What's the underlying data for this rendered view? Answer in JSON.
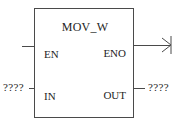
{
  "diagram": {
    "kind": "function-block-diagram",
    "block": {
      "title": "MOV_W",
      "inputs": [
        {
          "pin": "EN",
          "operand": ""
        },
        {
          "pin": "IN",
          "operand": "????"
        }
      ],
      "outputs": [
        {
          "pin": "ENO",
          "operand": ""
        },
        {
          "pin": "OUT",
          "operand": "????"
        }
      ]
    },
    "pins": {
      "en": "EN",
      "eno": "ENO",
      "in": "IN",
      "out": "OUT"
    },
    "operands": {
      "in": "????",
      "out": "????"
    },
    "icons": {
      "output_terminator": "arrow-right-terminator-icon"
    },
    "colors": {
      "background": "#ffffff",
      "line": "#4a4a4a",
      "text": "#1e1e1e"
    }
  }
}
